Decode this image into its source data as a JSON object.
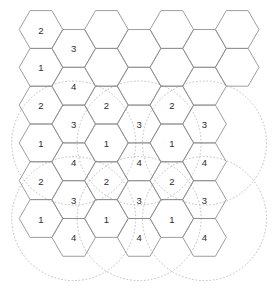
{
  "figure": {
    "type": "hexagonal-cell-cluster-diagram",
    "width": 275,
    "height": 298,
    "background_color": "#ffffff",
    "hex_stroke_color": "#8d8d8d",
    "circle_stroke_color": "#b9b9b9",
    "label_color": "#2b2b2b"
  },
  "geometry": {
    "hex_radius": 21.8,
    "hex_orientation": "flat-top",
    "col_step": 32.7,
    "row_step": 37.8,
    "col_offset_y": 18.9,
    "origin_x": 41.0,
    "origin_y": 29.5
  },
  "cells": [
    {
      "id": "c00",
      "col": 0,
      "row": 0,
      "cx": 41.0,
      "cy": 29.5,
      "label": "2"
    },
    {
      "id": "c01",
      "col": 0,
      "row": 1,
      "cx": 41.0,
      "cy": 67.3,
      "label": "1"
    },
    {
      "id": "c02",
      "col": 0,
      "row": 2,
      "cx": 41.0,
      "cy": 105.1,
      "label": "2"
    },
    {
      "id": "c03",
      "col": 0,
      "row": 3,
      "cx": 41.0,
      "cy": 142.9,
      "label": "1"
    },
    {
      "id": "c04",
      "col": 0,
      "row": 4,
      "cx": 41.0,
      "cy": 180.7,
      "label": "2"
    },
    {
      "id": "c05",
      "col": 0,
      "row": 5,
      "cx": 41.0,
      "cy": 218.5,
      "label": "1"
    },
    {
      "id": "c10",
      "col": 1,
      "row": 0,
      "cx": 73.7,
      "cy": 48.4,
      "label": "3"
    },
    {
      "id": "c11",
      "col": 1,
      "row": 1,
      "cx": 73.7,
      "cy": 86.2,
      "label": "4"
    },
    {
      "id": "c12",
      "col": 1,
      "row": 2,
      "cx": 73.7,
      "cy": 124.0,
      "label": "3"
    },
    {
      "id": "c13",
      "col": 1,
      "row": 3,
      "cx": 73.7,
      "cy": 161.8,
      "label": "4"
    },
    {
      "id": "c14",
      "col": 1,
      "row": 4,
      "cx": 73.7,
      "cy": 199.6,
      "label": "3"
    },
    {
      "id": "c15",
      "col": 1,
      "row": 5,
      "cx": 73.7,
      "cy": 237.4,
      "label": "4"
    },
    {
      "id": "c20",
      "col": 2,
      "row": 0,
      "cx": 106.4,
      "cy": 29.5,
      "label": ""
    },
    {
      "id": "c21",
      "col": 2,
      "row": 1,
      "cx": 106.4,
      "cy": 67.3,
      "label": ""
    },
    {
      "id": "c22",
      "col": 2,
      "row": 2,
      "cx": 106.4,
      "cy": 105.1,
      "label": "2"
    },
    {
      "id": "c23",
      "col": 2,
      "row": 3,
      "cx": 106.4,
      "cy": 142.9,
      "label": "1"
    },
    {
      "id": "c24",
      "col": 2,
      "row": 4,
      "cx": 106.4,
      "cy": 180.7,
      "label": "2"
    },
    {
      "id": "c25",
      "col": 2,
      "row": 5,
      "cx": 106.4,
      "cy": 218.5,
      "label": "1"
    },
    {
      "id": "c30",
      "col": 3,
      "row": 0,
      "cx": 139.1,
      "cy": 48.4,
      "label": ""
    },
    {
      "id": "c31",
      "col": 3,
      "row": 1,
      "cx": 139.1,
      "cy": 86.2,
      "label": ""
    },
    {
      "id": "c32",
      "col": 3,
      "row": 2,
      "cx": 139.1,
      "cy": 124.0,
      "label": "3"
    },
    {
      "id": "c33",
      "col": 3,
      "row": 3,
      "cx": 139.1,
      "cy": 161.8,
      "label": "4"
    },
    {
      "id": "c34",
      "col": 3,
      "row": 4,
      "cx": 139.1,
      "cy": 199.6,
      "label": "3"
    },
    {
      "id": "c35",
      "col": 3,
      "row": 5,
      "cx": 139.1,
      "cy": 237.4,
      "label": "4"
    },
    {
      "id": "c40",
      "col": 4,
      "row": 0,
      "cx": 171.8,
      "cy": 29.5,
      "label": ""
    },
    {
      "id": "c41",
      "col": 4,
      "row": 1,
      "cx": 171.8,
      "cy": 67.3,
      "label": ""
    },
    {
      "id": "c42",
      "col": 4,
      "row": 2,
      "cx": 171.8,
      "cy": 105.1,
      "label": "2"
    },
    {
      "id": "c43",
      "col": 4,
      "row": 3,
      "cx": 171.8,
      "cy": 142.9,
      "label": "1"
    },
    {
      "id": "c44",
      "col": 4,
      "row": 4,
      "cx": 171.8,
      "cy": 180.7,
      "label": "2"
    },
    {
      "id": "c45",
      "col": 4,
      "row": 5,
      "cx": 171.8,
      "cy": 218.5,
      "label": "1"
    },
    {
      "id": "c50",
      "col": 5,
      "row": 0,
      "cx": 204.5,
      "cy": 48.4,
      "label": ""
    },
    {
      "id": "c51",
      "col": 5,
      "row": 1,
      "cx": 204.5,
      "cy": 86.2,
      "label": ""
    },
    {
      "id": "c52",
      "col": 5,
      "row": 2,
      "cx": 204.5,
      "cy": 124.0,
      "label": "3"
    },
    {
      "id": "c53",
      "col": 5,
      "row": 3,
      "cx": 204.5,
      "cy": 161.8,
      "label": "4"
    },
    {
      "id": "c54",
      "col": 5,
      "row": 4,
      "cx": 204.5,
      "cy": 199.6,
      "label": "3"
    },
    {
      "id": "c55",
      "col": 5,
      "row": 5,
      "cx": 204.5,
      "cy": 237.4,
      "label": "4"
    },
    {
      "id": "c60",
      "col": 6,
      "row": 0,
      "cx": 237.2,
      "cy": 29.5,
      "label": ""
    },
    {
      "id": "c61",
      "col": 6,
      "row": 1,
      "cx": 237.2,
      "cy": 67.3,
      "label": ""
    }
  ],
  "coverage_circles": [
    {
      "id": "circle-left-mid",
      "cx": 73.7,
      "cy": 143.0,
      "r": 62.0
    },
    {
      "id": "circle-center-mid",
      "cx": 139.1,
      "cy": 143.0,
      "r": 62.0
    },
    {
      "id": "circle-right-mid",
      "cx": 204.5,
      "cy": 143.0,
      "r": 62.0
    },
    {
      "id": "circle-left-low",
      "cx": 73.7,
      "cy": 218.6,
      "r": 62.0
    },
    {
      "id": "circle-center-low",
      "cx": 139.1,
      "cy": 218.6,
      "r": 62.0
    },
    {
      "id": "circle-right-low",
      "cx": 204.5,
      "cy": 218.6,
      "r": 62.0
    }
  ],
  "chart_data": {
    "type": "diagram",
    "title": "",
    "cluster_size": 4,
    "channel_labels": [
      "1",
      "2",
      "3",
      "4"
    ],
    "grid_columns": 7,
    "grid_rows": 6,
    "labeled_cell_count": 30,
    "unlabeled_cell_count": 8,
    "coverage_circle_count": 6,
    "label_sequence_column_a": [
      "2",
      "1",
      "2",
      "1",
      "2",
      "1"
    ],
    "label_sequence_column_b": [
      "3",
      "4",
      "3",
      "4",
      "3",
      "4"
    ]
  }
}
